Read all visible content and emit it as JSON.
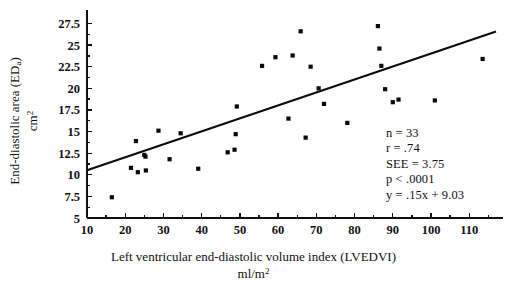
{
  "chart_data": {
    "type": "scatter",
    "title": "",
    "xlabel": "Left ventricular end-diastolic volume index (LVEDVI)",
    "xlabel_units": "ml/m",
    "xlabel_units_exp": "2",
    "ylabel": "End-diastolic area (ED",
    "ylabel_sub": "a",
    "ylabel_close": ")",
    "ylabel_units": "cm",
    "ylabel_units_exp": "2",
    "xlim": [
      10,
      117
    ],
    "ylim": [
      5,
      28.6
    ],
    "xticks": [
      10,
      20,
      30,
      40,
      50,
      60,
      70,
      80,
      90,
      100,
      110
    ],
    "yticks": [
      5,
      7.5,
      10,
      12.5,
      15,
      17.5,
      20,
      22.5,
      25,
      27.5
    ],
    "grid": false,
    "legend": "none",
    "marker": "square",
    "points": [
      {
        "x": 16.5,
        "y": 7.4
      },
      {
        "x": 21.5,
        "y": 10.8
      },
      {
        "x": 22.8,
        "y": 13.9
      },
      {
        "x": 23.3,
        "y": 10.3
      },
      {
        "x": 25.0,
        "y": 12.3
      },
      {
        "x": 25.3,
        "y": 12.1
      },
      {
        "x": 25.4,
        "y": 10.5
      },
      {
        "x": 28.7,
        "y": 15.1
      },
      {
        "x": 31.6,
        "y": 11.8
      },
      {
        "x": 34.5,
        "y": 14.8
      },
      {
        "x": 39.1,
        "y": 10.7
      },
      {
        "x": 46.8,
        "y": 12.6
      },
      {
        "x": 48.6,
        "y": 12.9
      },
      {
        "x": 48.9,
        "y": 14.7
      },
      {
        "x": 49.2,
        "y": 17.9
      },
      {
        "x": 55.8,
        "y": 22.6
      },
      {
        "x": 59.3,
        "y": 23.6
      },
      {
        "x": 62.7,
        "y": 16.5
      },
      {
        "x": 63.8,
        "y": 23.8
      },
      {
        "x": 65.9,
        "y": 26.6
      },
      {
        "x": 67.2,
        "y": 14.3
      },
      {
        "x": 68.5,
        "y": 22.5
      },
      {
        "x": 70.6,
        "y": 20.0
      },
      {
        "x": 72.0,
        "y": 18.2
      },
      {
        "x": 78.1,
        "y": 16.0
      },
      {
        "x": 86.1,
        "y": 27.2
      },
      {
        "x": 86.5,
        "y": 24.6
      },
      {
        "x": 87.0,
        "y": 22.6
      },
      {
        "x": 88.0,
        "y": 19.9
      },
      {
        "x": 90.0,
        "y": 18.4
      },
      {
        "x": 91.5,
        "y": 18.7
      },
      {
        "x": 101.0,
        "y": 18.6
      },
      {
        "x": 113.5,
        "y": 23.4
      }
    ],
    "regression": {
      "slope": 0.15,
      "intercept": 9.03,
      "x_start": 10,
      "x_end": 117
    },
    "annotations": {
      "n": "n = 33",
      "r": "r = .74",
      "see": "SEE = 3.75",
      "p": "p < .0001",
      "equation": "y = .15x + 9.03"
    }
  }
}
